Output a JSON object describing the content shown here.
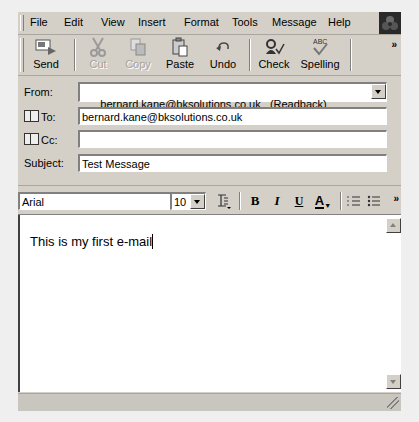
{
  "menu": {
    "items": [
      "File",
      "Edit",
      "View",
      "Insert",
      "Format",
      "Tools",
      "Message",
      "Help"
    ]
  },
  "toolbar": {
    "buttons": [
      {
        "label": "Send",
        "icon": "send-icon",
        "enabled": true
      },
      {
        "label": "Cut",
        "icon": "scissors-icon",
        "enabled": false
      },
      {
        "label": "Copy",
        "icon": "copy-icon",
        "enabled": false
      },
      {
        "label": "Paste",
        "icon": "paste-icon",
        "enabled": true
      },
      {
        "label": "Undo",
        "icon": "undo-icon",
        "enabled": true
      },
      {
        "label": "Check",
        "icon": "check-names-icon",
        "enabled": true
      },
      {
        "label": "Spelling",
        "icon": "spelling-icon",
        "enabled": true
      }
    ],
    "overflow": "»"
  },
  "header": {
    "from_label": "From:",
    "from_value": "bernard.kane@bksolutions.co.uk   (Readback)",
    "to_label": "To:",
    "to_value": "bernard.kane@bksolutions.co.uk",
    "cc_label": "Cc:",
    "cc_value": "",
    "subject_label": "Subject:",
    "subject_value": "Test Message"
  },
  "format": {
    "font": "Arial",
    "size": "10",
    "bold": "B",
    "italic": "I",
    "underline": "U",
    "font_color": "A",
    "overflow": "»"
  },
  "body": {
    "text": "This is my first e-mail"
  }
}
